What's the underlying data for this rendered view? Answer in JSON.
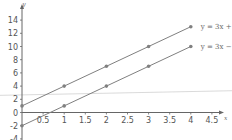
{
  "chart_data": {
    "type": "line",
    "title": "",
    "xlabel": "x",
    "ylabel": "y",
    "xlim": [
      0,
      4.6
    ],
    "ylim": [
      -4,
      14.5
    ],
    "x_ticks": [
      0.5,
      1,
      1.5,
      2,
      2.5,
      3,
      3.5,
      4,
      4.5
    ],
    "x_tick_labels": [
      "0.5",
      "1",
      "1.5",
      "2",
      "2.5",
      "3",
      "3.5",
      "4",
      "4.5"
    ],
    "y_ticks": [
      -4,
      -2,
      0,
      2,
      4,
      6,
      8,
      10,
      12,
      14
    ],
    "y_tick_labels": [
      "-4",
      "-2",
      "0",
      "2",
      "4",
      "6",
      "8",
      "10",
      "12",
      "14"
    ],
    "grid": false,
    "legend_placement": "inline-right",
    "series": [
      {
        "name": "y = 3x + 1",
        "x": [
          0,
          1,
          2,
          3,
          4
        ],
        "values": [
          1,
          4,
          7,
          10,
          13
        ],
        "color": "#808080"
      },
      {
        "name": "y = 3x − 2",
        "x": [
          0,
          1,
          2,
          3,
          4
        ],
        "values": [
          -2,
          1,
          4,
          7,
          10
        ],
        "color": "#808080"
      }
    ],
    "reference_line": {
      "from": [
        -0.5,
        2.6
      ],
      "to": [
        4.6,
        3.3
      ],
      "color": "#d0d0d0"
    }
  }
}
